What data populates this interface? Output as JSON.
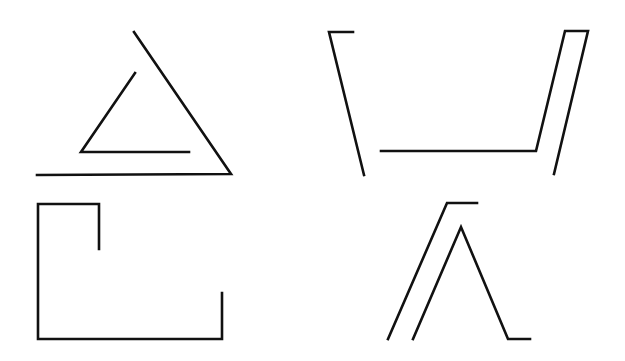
{
  "style": {
    "stroke_color": "#111111",
    "stroke_width": 2.6,
    "background": "#ffffff"
  },
  "figures": [
    {
      "name": "figure-triangle-nested",
      "paths": [
        {
          "name": "outer-triangle-line",
          "points": [
            [
              37,
              175
            ],
            [
              231,
              174
            ],
            [
              134,
              32
            ]
          ]
        },
        {
          "name": "inner-triangle-line",
          "points": [
            [
              135,
              73
            ],
            [
              81,
              152
            ],
            [
              189,
              152
            ]
          ]
        }
      ]
    },
    {
      "name": "figure-trapezoid-open",
      "paths": [
        {
          "name": "left-bracket-line",
          "points": [
            [
              353,
              32
            ],
            [
              329,
              32
            ],
            [
              364,
              175
            ]
          ]
        },
        {
          "name": "right-hook-line",
          "points": [
            [
              381,
              151
            ],
            [
              536,
              151
            ],
            [
              565,
              31
            ],
            [
              588,
              31
            ],
            [
              554,
              174
            ]
          ]
        }
      ]
    },
    {
      "name": "figure-rectangle-open",
      "paths": [
        {
          "name": "bracket-outline",
          "points": [
            [
              99,
              249
            ],
            [
              99,
              204
            ],
            [
              38,
              204
            ],
            [
              38,
              339
            ],
            [
              222,
              339
            ],
            [
              222,
              293
            ]
          ]
        }
      ]
    },
    {
      "name": "figure-peak-double",
      "paths": [
        {
          "name": "left-slope-line",
          "points": [
            [
              388,
              339
            ],
            [
              447,
              203
            ],
            [
              477,
              203
            ]
          ]
        },
        {
          "name": "inner-peak-line",
          "points": [
            [
              413,
              339
            ],
            [
              461,
              227
            ],
            [
              508,
              339
            ],
            [
              530,
              339
            ]
          ]
        }
      ]
    }
  ]
}
